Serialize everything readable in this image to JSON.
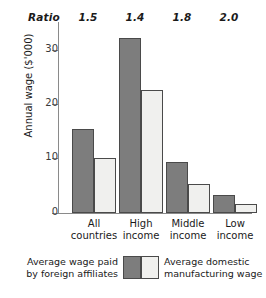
{
  "chart_data": {
    "type": "bar",
    "title": "",
    "xlabel": "",
    "ylabel": "Annual wage ($'000)",
    "ylim": [
      0,
      35
    ],
    "yticks": [
      0,
      10,
      20,
      30
    ],
    "ytick_labels": [
      "0",
      "10",
      "20",
      "30"
    ],
    "grid": false,
    "legend_position": "bottom",
    "categories": [
      "All countries",
      "High income",
      "Middle income",
      "Low income"
    ],
    "category_lines": [
      [
        "All",
        "countries"
      ],
      [
        "High",
        "income"
      ],
      [
        "Middle",
        "income"
      ],
      [
        "Low",
        "income"
      ]
    ],
    "series": [
      {
        "name": "Average wage paid by foreign affiliates",
        "name_lines": [
          "Average wage paid",
          "by foreign affiliates"
        ],
        "color": "#7d7d7d",
        "values": [
          15.4,
          32.3,
          9.4,
          3.3
        ]
      },
      {
        "name": "Average domestic manufacturing wage",
        "name_lines": [
          "Average domestic",
          "manufacturing wage"
        ],
        "color": "#f0f0ee",
        "values": [
          10.1,
          22.6,
          5.4,
          1.7
        ]
      }
    ],
    "annotation_row": {
      "label": "Ratio",
      "values": [
        "1.5",
        "1.4",
        "1.8",
        "2.0"
      ]
    }
  },
  "colors": {
    "foreign_affiliates": "#7d7d7d",
    "domestic_manufacturing": "#f0f0ee",
    "axis": "#8a8a8a",
    "bar_outline": "#4a4a4a",
    "background": "#ffffff"
  }
}
